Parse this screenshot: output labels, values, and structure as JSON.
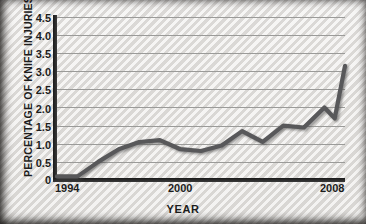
{
  "chart_data": {
    "type": "line",
    "title": "",
    "xlabel": "YEAR",
    "ylabel": "PERCENTAGE OF KNIFE INJURIES",
    "xlim": [
      1994,
      2008
    ],
    "ylim": [
      0,
      4.5
    ],
    "grid": true,
    "legend": "none",
    "line_color": "#58585a",
    "y_ticks": [
      "4.5",
      "4.0",
      "3.5",
      "3.0",
      "2.5",
      "2.0",
      "1.5",
      "1.0",
      "0.5",
      "0"
    ],
    "y_tick_values": [
      4.5,
      4.0,
      3.5,
      3.0,
      2.5,
      2.0,
      1.5,
      1.0,
      0.5,
      0
    ],
    "x_ticks": [
      "1994",
      "2000",
      "2008"
    ],
    "x_tick_values": [
      1994,
      2000,
      2008
    ],
    "x": [
      1994,
      1995,
      1996,
      1997,
      1998,
      1999,
      2000,
      2001,
      2002,
      2003,
      2004,
      2005,
      2006,
      2007,
      2007.5,
      2008
    ],
    "values": [
      0.1,
      0.1,
      0.5,
      0.85,
      1.05,
      1.1,
      0.85,
      0.8,
      0.95,
      1.35,
      1.05,
      1.5,
      1.45,
      2.0,
      1.7,
      3.15
    ],
    "series": [
      {
        "name": "Percentage of knife injuries",
        "values": [
          0.1,
          0.1,
          0.5,
          0.85,
          1.05,
          1.1,
          0.85,
          0.8,
          0.95,
          1.35,
          1.05,
          1.5,
          1.45,
          2.0,
          1.7,
          3.15
        ]
      }
    ]
  }
}
